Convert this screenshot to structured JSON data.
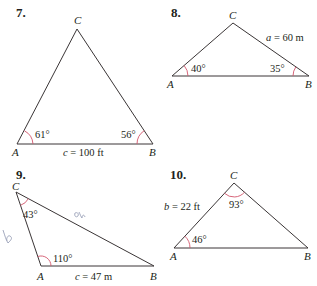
{
  "problems": [
    {
      "number": "7.",
      "vertices": {
        "A": "A",
        "B": "B",
        "C": "C"
      },
      "angle_A": "61°",
      "angle_B": "56°",
      "side_c_var": "c",
      "side_c_value": "= 100 ft"
    },
    {
      "number": "8.",
      "vertices": {
        "A": "A",
        "B": "B",
        "C": "C"
      },
      "angle_A": "40°",
      "angle_B": "35°",
      "side_a_var": "a",
      "side_a_value": "= 60 m"
    },
    {
      "number": "9.",
      "vertices": {
        "A": "A",
        "B": "B",
        "C": "C"
      },
      "angle_C": "43°",
      "angle_A": "110°",
      "side_c_var": "c",
      "side_c_value": "= 47 m",
      "handwritten": [
        "b",
        "a"
      ]
    },
    {
      "number": "10.",
      "vertices": {
        "A": "A",
        "B": "B",
        "C": "C"
      },
      "angle_A": "46°",
      "angle_C": "93°",
      "side_b_var": "b",
      "side_b_value": "= 22 ft"
    }
  ],
  "colors": {
    "line": "#3a3536",
    "angle_arc": "#d2556b",
    "text": "#231f20",
    "handwriting": "#9aa0b8"
  }
}
